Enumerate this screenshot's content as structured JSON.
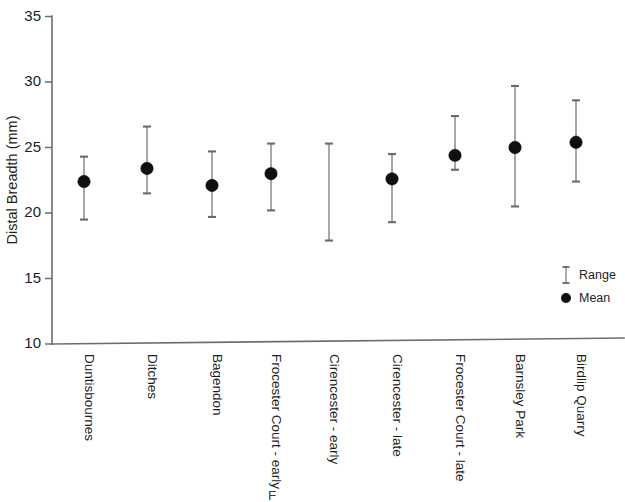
{
  "chart_data": {
    "type": "scatter",
    "title": "",
    "xlabel": "",
    "ylabel": "Distal Breadth (mm)",
    "ylim": [
      10,
      35
    ],
    "yticks": [
      10,
      15,
      20,
      25,
      30,
      35
    ],
    "ytick_labels": [
      "10",
      "15",
      "20",
      "25",
      "30",
      "35"
    ],
    "grid": false,
    "legend_position": "inside-right",
    "categories": [
      "Duntisbournes",
      "Ditches",
      "Bagendon",
      "Frocester Court - early",
      "Cirencester - early",
      "Cirencester - late",
      "Frocester Court - late",
      "Barnsley Park",
      "Birdlip Quarry"
    ],
    "series": [
      {
        "name": "Mean",
        "values": [
          22.4,
          23.4,
          22.1,
          23.0,
          null,
          22.6,
          24.4,
          25.0,
          25.4
        ]
      },
      {
        "name": "Range low",
        "values": [
          19.5,
          21.5,
          19.7,
          20.2,
          17.9,
          19.3,
          23.3,
          20.5,
          22.4
        ]
      },
      {
        "name": "Range high",
        "values": [
          24.3,
          26.6,
          24.7,
          25.3,
          25.3,
          24.5,
          27.4,
          29.7,
          28.6
        ]
      }
    ]
  },
  "legend": {
    "items": [
      {
        "label": "Range",
        "marker": "error-bar",
        "color": "#8a8a8a"
      },
      {
        "label": "Mean",
        "marker": "filled-circle",
        "color": "#101010"
      }
    ]
  },
  "axes": {
    "y_title": "Distal Breadth (mm)"
  },
  "artifacts": {
    "bottom_fragment": "F"
  },
  "colors": {
    "axis": "#6d6d6d",
    "range": "#8a8a8a",
    "cap": "#6a6a6a",
    "mean": "#101010",
    "text": "#1d1d1d",
    "background": "#ffffff"
  }
}
